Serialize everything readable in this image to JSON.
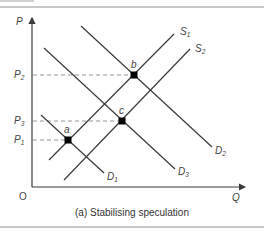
{
  "figure": {
    "caption": "(a) Stabilising speculation",
    "axes": {
      "y_label": "P",
      "x_label": "Q",
      "origin_label": "O"
    },
    "price_levels": [
      {
        "label": "P",
        "sub": "2",
        "y": 75
      },
      {
        "label": "P",
        "sub": "3",
        "y": 121
      },
      {
        "label": "P",
        "sub": "1",
        "y": 140
      }
    ],
    "curves": [
      {
        "id": "D1",
        "label": "D",
        "sub": "1",
        "type": "demand",
        "x1": 41,
        "y1": 115,
        "x2": 104,
        "y2": 173,
        "lx": 107,
        "ly": 180
      },
      {
        "id": "D2",
        "label": "D",
        "sub": "2",
        "type": "demand",
        "x1": 81,
        "y1": 26,
        "x2": 212,
        "y2": 147,
        "lx": 215,
        "ly": 154
      },
      {
        "id": "D3",
        "label": "D",
        "sub": "3",
        "type": "demand",
        "x1": 44,
        "y1": 48,
        "x2": 175,
        "y2": 169,
        "lx": 178,
        "ly": 175
      },
      {
        "id": "S1",
        "label": "S",
        "sub": "1",
        "type": "supply",
        "x1": 49,
        "y1": 160,
        "x2": 174,
        "y2": 34,
        "lx": 180,
        "ly": 35
      },
      {
        "id": "S2",
        "label": "S",
        "sub": "2",
        "type": "supply",
        "x1": 64,
        "y1": 180,
        "x2": 190,
        "y2": 49,
        "lx": 195,
        "ly": 52
      }
    ],
    "points": [
      {
        "label": "a",
        "x": 68,
        "y": 140,
        "lx": 64,
        "ly": 133
      },
      {
        "label": "b",
        "x": 134,
        "y": 75,
        "lx": 131,
        "ly": 68
      },
      {
        "label": "c",
        "x": 122,
        "y": 121,
        "lx": 119,
        "ly": 114
      }
    ],
    "colors": {
      "line": "#3a3a3a",
      "dash": "#8a8a8a",
      "point": "#000000",
      "rule": "#c8c8c8"
    }
  }
}
